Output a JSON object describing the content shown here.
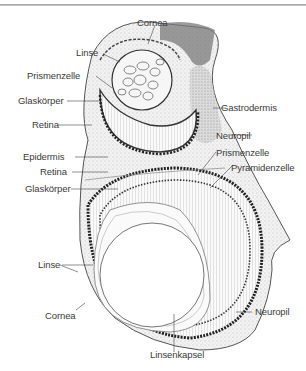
{
  "figure": {
    "type": "labeled anatomical illustration",
    "colors": {
      "ink": "#3a3a3a",
      "stipple": "#8a8a8a",
      "background": "#ffffff",
      "rule": "#9a9a9a"
    }
  },
  "labels": {
    "upper_eye": {
      "cornea": "Cornea",
      "linse": "Linse",
      "prismenzelle": "Prismenzelle",
      "glaskoerper": "Glaskörper",
      "retina": "Retina",
      "gastrodermis": "Gastrodermis",
      "neuropil": "Neuropil"
    },
    "lower_eye": {
      "epidermis": "Epidermis",
      "retina": "Retina",
      "glaskoerper": "Glaskörper",
      "prismenzelle": "Prismenzelle",
      "pyramidenzelle": "Pyramidenzelle",
      "linse": "Linse",
      "cornea": "Cornea",
      "neuropil": "Neuropil",
      "linsenkapsel": "Linsenkapsel"
    }
  }
}
